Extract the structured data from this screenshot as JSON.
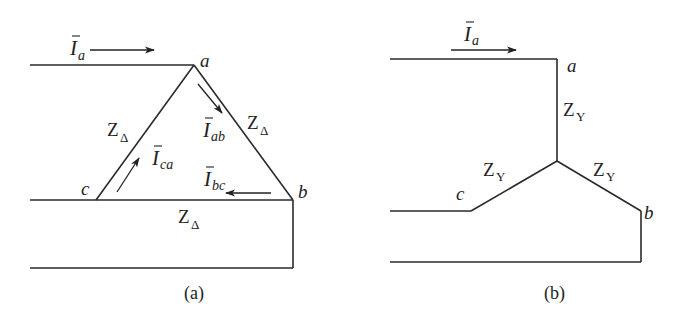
{
  "figure_a": {
    "caption": "(a)",
    "title": "Delta-connected load",
    "nodes": {
      "a": "a",
      "b": "b",
      "c": "c"
    },
    "line_current": {
      "symbol": "I",
      "sub": "a"
    },
    "phase_currents": [
      {
        "symbol": "I",
        "sub": "ab"
      },
      {
        "symbol": "I",
        "sub": "bc"
      },
      {
        "symbol": "I",
        "sub": "ca"
      }
    ],
    "impedances": [
      {
        "symbol": "Z",
        "sub": "Δ"
      },
      {
        "symbol": "Z",
        "sub": "Δ"
      },
      {
        "symbol": "Z",
        "sub": "Δ"
      }
    ]
  },
  "figure_b": {
    "caption": "(b)",
    "title": "Wye-connected load",
    "nodes": {
      "a": "a",
      "b": "b",
      "c": "c"
    },
    "line_current": {
      "symbol": "I",
      "sub": "a"
    },
    "impedances": [
      {
        "symbol": "Z",
        "sub": "Y"
      },
      {
        "symbol": "Z",
        "sub": "Y"
      },
      {
        "symbol": "Z",
        "sub": "Y"
      }
    ]
  },
  "colors": {
    "line": "#2a2a2a",
    "background": "#ffffff"
  }
}
